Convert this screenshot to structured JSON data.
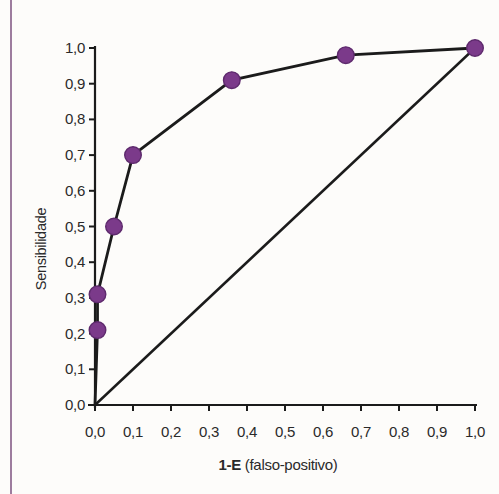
{
  "page": {
    "background": "#fdfcfa",
    "left_rule_color": "#9d7c9e",
    "text_color": "#2a2a2a"
  },
  "chart_data": {
    "type": "line",
    "title": "",
    "xlabel": "1-E (falso-positivo)",
    "xlabel_bold": "1-E",
    "xlabel_rest": " (falso-positivo)",
    "ylabel": "Sensibilidade",
    "xlim": [
      0,
      1
    ],
    "ylim": [
      0,
      1
    ],
    "tick_step": 0.1,
    "grid": false,
    "legend_position": "none",
    "axis_color": "#1b1b1b",
    "x_tick_labels": [
      "0,0",
      "0,1",
      "0,2",
      "0,3",
      "0,4",
      "0,5",
      "0,6",
      "0,7",
      "0,8",
      "0,9",
      "1,0"
    ],
    "y_tick_labels": [
      "0,0",
      "0,1",
      "0,2",
      "0,3",
      "0,4",
      "0,5",
      "0,6",
      "0,7",
      "0,8",
      "0,9",
      "1,0"
    ],
    "series": [
      {
        "name": "curva-roc",
        "type": "line-with-markers",
        "color": "#1b1b1b",
        "line_width": 2.8,
        "marker_color": "#7b3a8a",
        "marker_edge_color": "#5e2a6d",
        "marker_radius": 8.3,
        "x": [
          0.0,
          0.0,
          0.0,
          0.05,
          0.1,
          0.36,
          0.66,
          1.0
        ],
        "y": [
          0.0,
          0.21,
          0.31,
          0.5,
          0.7,
          0.91,
          0.98,
          1.0
        ],
        "markers": [
          [
            0.0,
            0.21
          ],
          [
            0.0,
            0.31
          ],
          [
            0.05,
            0.5
          ],
          [
            0.1,
            0.7
          ],
          [
            0.36,
            0.91
          ],
          [
            0.66,
            0.98
          ],
          [
            1.0,
            1.0
          ]
        ]
      },
      {
        "name": "linha-de-referencia",
        "type": "line",
        "color": "#1b1b1b",
        "line_width": 2.5,
        "x": [
          0.0,
          1.0
        ],
        "y": [
          0.0,
          1.0
        ]
      }
    ]
  }
}
